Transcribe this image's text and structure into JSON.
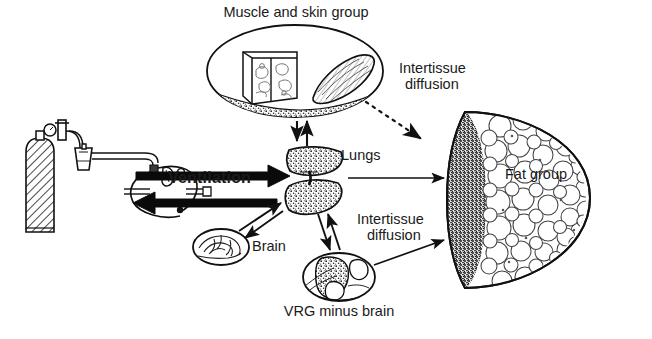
{
  "figure": {
    "type": "physiological-compartment-diagram"
  },
  "labels": {
    "muscle_skin_group": "Muscle and skin group",
    "intertissue_diffusion_top": "Intertissue\ndiffusion",
    "intertissue_diffusion_top_line1": "Intertissue",
    "intertissue_diffusion_top_line2": "diffusion",
    "intertissue_diffusion_bottom_line1": "Intertissue",
    "intertissue_diffusion_bottom_line2": "diffusion",
    "lungs": "Lungs",
    "fat_group": "Fat group",
    "ventilation": "Ventilation",
    "brain": "Brain",
    "vrg_minus_brain": "VRG minus brain"
  },
  "compartments": [
    {
      "id": "muscle-skin-group",
      "label": "Muscle and skin group",
      "shape": "ellipse",
      "contents": "skin cube and muscle belly on granular bed"
    },
    {
      "id": "lungs",
      "label": "Lungs",
      "shape": "paired-stippled-wedges"
    },
    {
      "id": "fat-group",
      "label": "Fat group",
      "shape": "large-dome",
      "contents": "adipocyte cells"
    },
    {
      "id": "brain",
      "label": "Brain",
      "shape": "small-ellipse"
    },
    {
      "id": "vrg-minus-brain",
      "label": "VRG minus brain",
      "shape": "ellipse",
      "contents": "viscera"
    }
  ],
  "flows": [
    {
      "id": "ventilation-in",
      "label": "Ventilation",
      "style": "thick-solid",
      "direction": "apparatus-to-lungs"
    },
    {
      "id": "ventilation-out",
      "label": "",
      "style": "thick-solid",
      "direction": "lungs-to-apparatus"
    },
    {
      "id": "lungs-muscle-skin",
      "label": "",
      "style": "thin-double",
      "direction": "bidirectional"
    },
    {
      "id": "lungs-fat",
      "label": "",
      "style": "thin-solid",
      "direction": "lungs-to-fat"
    },
    {
      "id": "lungs-brain",
      "label": "",
      "style": "thin-double",
      "direction": "bidirectional"
    },
    {
      "id": "lungs-vrg",
      "label": "",
      "style": "thin-double",
      "direction": "bidirectional"
    },
    {
      "id": "muscle-skin-to-fat",
      "label": "Intertissue diffusion",
      "style": "dotted",
      "direction": "muscle-skin-to-fat"
    },
    {
      "id": "vrg-to-fat",
      "label": "Intertissue diffusion",
      "style": "thin-solid",
      "direction": "vrg-to-fat"
    }
  ],
  "apparatus": {
    "id": "anesthesia-machine",
    "parts": [
      "gas-cylinder",
      "pressure-gauge",
      "regulator-valve",
      "vaporizer",
      "tubing",
      "breathing-circuit",
      "face-mask"
    ]
  },
  "colors": {
    "ink": "#1a1a1a",
    "line": "#111111",
    "fill": "#ffffff",
    "stipple": "#333333",
    "paper": "#ffffff"
  }
}
